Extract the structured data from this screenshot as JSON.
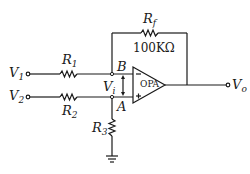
{
  "diagram": {
    "type": "op-amp differential amplifier circuit",
    "inputs": [
      {
        "symbol": "V",
        "sub": "1",
        "node": "B",
        "via": "R1"
      },
      {
        "symbol": "V",
        "sub": "2",
        "node": "A",
        "via": "R2"
      }
    ],
    "output": {
      "symbol": "V",
      "sub": "o"
    },
    "resistors": [
      {
        "symbol": "R",
        "sub": "1"
      },
      {
        "symbol": "R",
        "sub": "2"
      },
      {
        "symbol": "R",
        "sub": "3"
      },
      {
        "symbol": "R",
        "sub": "f",
        "value": "100KΩ"
      }
    ],
    "nodes": {
      "B": "B",
      "A": "A"
    },
    "differential_voltage": {
      "symbol": "V",
      "sub": "i"
    },
    "opamp": {
      "label": "OPA",
      "inverting": "−",
      "noninverting": "+"
    }
  }
}
